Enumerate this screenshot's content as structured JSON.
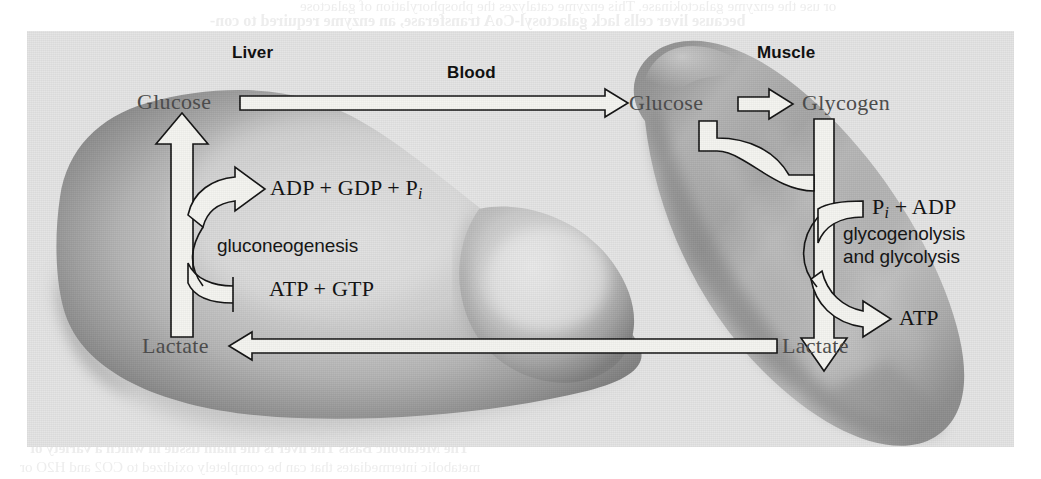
{
  "figure": {
    "background_color": "#e3e3e3",
    "page_color": "#ffffff"
  },
  "organ_labels": {
    "liver": "Liver",
    "blood": "Blood",
    "muscle": "Muscle"
  },
  "liver": {
    "glucose": "Glucose",
    "lactate": "Lactate",
    "products": "ADP + GDP + P",
    "products_sub": "i",
    "reactants": "ATP + GTP",
    "pathway": "gluconeogenesis"
  },
  "muscle": {
    "glucose": "Glucose",
    "glycogen": "Glycogen",
    "lactate": "Lactate",
    "reactants": "P",
    "reactants_sub": "i",
    "reactants_rest": " + ADP",
    "product": "ATP",
    "pathway_line1": "glycogenolysis",
    "pathway_line2": "and glycolysis"
  },
  "arrows": {
    "blood_glucose_to_muscle": "Glucose transported in blood from liver to muscle",
    "blood_lactate_to_liver": "Lactate transported in blood from muscle to liver",
    "liver_lactate_to_glucose": "Lactate converted to glucose in liver",
    "muscle_glucose_to_glycogen": "Glucose converted to glycogen in muscle",
    "muscle_glycogen_to_lactate": "Glycogen broken down to lactate in muscle"
  },
  "show_through_text": {
    "top_line1": "or use the enzyme galactokinase. This enzyme catalyzes the phosphorylation of galactose",
    "top_line2": "because liver cells lack galactosyl-CoA transferase, an enzyme required to con-",
    "bottom_line1": "The Metabolic Basis  The liver is the main tissue in which a variety of",
    "bottom_line2": "metabolic intermediates that can be completely oxidized to CO2 and H2O or"
  }
}
